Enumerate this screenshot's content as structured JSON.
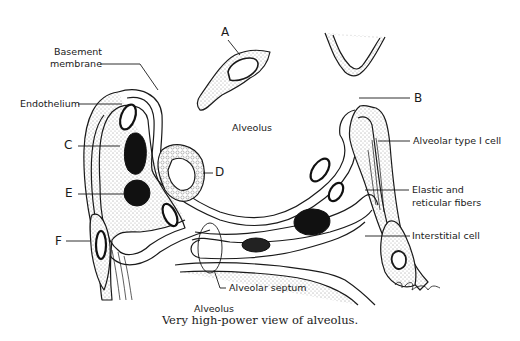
{
  "figure": {
    "caption": "Very high-power view of alveolus.",
    "letters": {
      "A": "A",
      "B": "B",
      "C": "C",
      "D": "D",
      "E": "E",
      "F": "F"
    },
    "labels": {
      "basement_membrane_1": "Basement",
      "basement_membrane_2": "membrane",
      "endothelium": "Endothelium",
      "alveolus_top": "Alveolus",
      "alveolus_bottom": "Alveolus",
      "alveolar_type_1_cell": "Alveolar type I cell",
      "elastic_fibers_1": "Elastic and",
      "elastic_fibers_2": "reticular fibers",
      "interstitial_cell": "Interstitial cell",
      "alveolar_septum": "Alveolar septum"
    },
    "colors": {
      "ink": "#1a1a1a",
      "background": "#ffffff"
    }
  }
}
